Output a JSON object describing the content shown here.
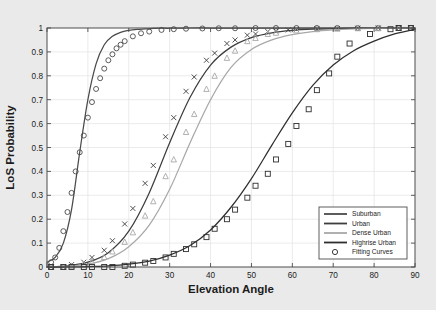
{
  "chart_data": {
    "type": "line",
    "title": "",
    "xlabel": "Elevation Angle",
    "ylabel": "LoS Probability",
    "xlim": [
      0,
      90
    ],
    "ylim": [
      0,
      1
    ],
    "xticks": [
      "0",
      "10",
      "20",
      "30",
      "40",
      "50",
      "60",
      "70",
      "80",
      "90"
    ],
    "yticks": [
      "0",
      "0.1",
      "0.2",
      "0.3",
      "0.4",
      "0.5",
      "0.6",
      "0.7",
      "0.8",
      "0.9",
      "1"
    ],
    "grid": true,
    "legend_position": "lower-right",
    "legend_entries": [
      {
        "label": "Suburban",
        "style": "line",
        "color": "#4a4a4a"
      },
      {
        "label": "Urban",
        "style": "line",
        "color": "#3d3d3d"
      },
      {
        "label": "Dense Urban",
        "style": "line",
        "color": "#a8a8a8"
      },
      {
        "label": "Highrise Urban",
        "style": "line",
        "color": "#2f2f2f"
      },
      {
        "label": "Fitting Curves",
        "style": "marker-circle",
        "color": "#3a3a3a"
      }
    ],
    "series": [
      {
        "name": "Suburban",
        "color": "#4a4a4a",
        "marker": "circle",
        "x": [
          0,
          2,
          4,
          6,
          8,
          10,
          12,
          14,
          16,
          18,
          20,
          22,
          24,
          26,
          28,
          30,
          35,
          40,
          45,
          50,
          55,
          60,
          65,
          70,
          75,
          80,
          85,
          90
        ],
        "y": [
          0.02,
          0.04,
          0.1,
          0.24,
          0.48,
          0.7,
          0.85,
          0.93,
          0.965,
          0.982,
          0.99,
          0.994,
          0.996,
          0.998,
          0.999,
          0.999,
          1.0,
          1.0,
          1.0,
          1.0,
          1.0,
          1.0,
          1.0,
          1.0,
          1.0,
          1.0,
          1.0,
          1.0
        ],
        "marker_x": [
          1,
          2,
          3,
          4,
          5,
          6,
          7,
          8,
          9,
          10,
          11,
          12,
          13,
          14,
          15,
          16,
          17,
          18,
          19,
          21,
          23,
          25,
          28,
          31,
          34,
          38,
          42,
          46,
          51,
          56,
          61,
          66,
          71,
          76,
          81,
          86,
          89
        ],
        "marker_y": [
          0.02,
          0.04,
          0.08,
          0.15,
          0.23,
          0.31,
          0.4,
          0.48,
          0.55,
          0.625,
          0.69,
          0.745,
          0.79,
          0.83,
          0.865,
          0.89,
          0.915,
          0.93,
          0.945,
          0.965,
          0.978,
          0.985,
          0.992,
          0.995,
          0.997,
          0.998,
          0.999,
          0.999,
          1.0,
          1.0,
          1.0,
          1.0,
          1.0,
          1.0,
          1.0,
          1.0,
          1.0
        ]
      },
      {
        "name": "Urban",
        "color": "#3d3d3d",
        "marker": "cross",
        "x": [
          0,
          5,
          10,
          15,
          20,
          25,
          30,
          35,
          40,
          45,
          50,
          55,
          60,
          65,
          70,
          75,
          80,
          85,
          90
        ],
        "y": [
          0.0,
          0.005,
          0.02,
          0.06,
          0.15,
          0.31,
          0.52,
          0.71,
          0.845,
          0.92,
          0.96,
          0.98,
          0.99,
          0.995,
          0.997,
          0.999,
          0.999,
          1.0,
          1.0
        ],
        "marker_x": [
          1,
          4,
          6,
          9,
          11,
          14,
          16,
          19,
          21,
          24,
          26,
          29,
          31,
          34,
          36,
          39,
          41,
          44,
          46,
          49,
          51,
          54,
          56,
          59,
          61,
          66,
          71,
          76,
          81,
          86
        ],
        "marker_y": [
          0.0,
          0.0,
          0.01,
          0.02,
          0.04,
          0.07,
          0.11,
          0.18,
          0.245,
          0.35,
          0.425,
          0.545,
          0.625,
          0.735,
          0.795,
          0.865,
          0.895,
          0.935,
          0.95,
          0.97,
          0.975,
          0.985,
          0.988,
          0.992,
          0.994,
          0.997,
          0.998,
          0.999,
          1.0,
          1.0
        ]
      },
      {
        "name": "Dense Urban",
        "color": "#a8a8a8",
        "marker": "triangle",
        "x": [
          0,
          5,
          10,
          15,
          20,
          25,
          30,
          35,
          40,
          45,
          50,
          55,
          60,
          65,
          70,
          75,
          80,
          85,
          90
        ],
        "y": [
          0.0,
          0.003,
          0.012,
          0.035,
          0.085,
          0.175,
          0.325,
          0.52,
          0.7,
          0.835,
          0.91,
          0.95,
          0.972,
          0.985,
          0.992,
          0.996,
          0.998,
          0.999,
          1.0
        ],
        "marker_x": [
          1,
          4,
          6,
          9,
          11,
          14,
          16,
          19,
          21,
          24,
          26,
          29,
          31,
          34,
          36,
          39,
          41,
          44,
          46,
          49,
          51,
          54,
          56,
          61,
          66,
          71,
          76,
          81,
          86
        ],
        "marker_y": [
          0.0,
          0.0,
          0.005,
          0.012,
          0.022,
          0.042,
          0.065,
          0.105,
          0.145,
          0.215,
          0.275,
          0.38,
          0.45,
          0.565,
          0.64,
          0.745,
          0.8,
          0.875,
          0.905,
          0.945,
          0.958,
          0.975,
          0.98,
          0.99,
          0.995,
          0.997,
          0.999,
          0.999,
          1.0
        ]
      },
      {
        "name": "Highrise Urban",
        "color": "#2f2f2f",
        "marker": "square",
        "x": [
          0,
          5,
          10,
          15,
          20,
          25,
          30,
          35,
          40,
          45,
          50,
          55,
          60,
          65,
          70,
          75,
          80,
          85,
          90
        ],
        "y": [
          0.0,
          0.0,
          0.002,
          0.005,
          0.012,
          0.025,
          0.05,
          0.09,
          0.155,
          0.25,
          0.37,
          0.51,
          0.645,
          0.76,
          0.845,
          0.905,
          0.945,
          0.975,
          0.995
        ],
        "marker_x": [
          1,
          4,
          6,
          9,
          11,
          14,
          16,
          19,
          21,
          24,
          26,
          29,
          31,
          34,
          36,
          39,
          41,
          44,
          46,
          49,
          51,
          54,
          56,
          59,
          61,
          64,
          66,
          69,
          71,
          74,
          79,
          84,
          86,
          89
        ],
        "marker_y": [
          0.0,
          0.0,
          0.0,
          0.0,
          0.0,
          0.0,
          0.0,
          0.005,
          0.01,
          0.018,
          0.025,
          0.04,
          0.055,
          0.075,
          0.095,
          0.125,
          0.16,
          0.2,
          0.24,
          0.29,
          0.34,
          0.39,
          0.45,
          0.515,
          0.59,
          0.66,
          0.74,
          0.81,
          0.88,
          0.935,
          0.975,
          0.995,
          1.0,
          1.0
        ]
      }
    ]
  }
}
